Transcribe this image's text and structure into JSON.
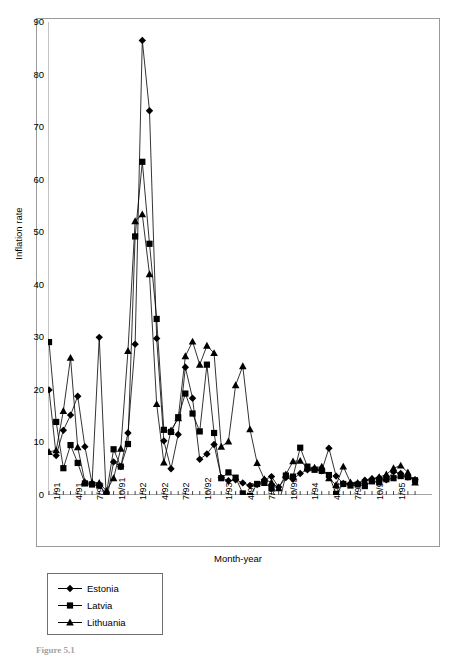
{
  "figure": {
    "caption": "Figure 5.1"
  },
  "axes": {
    "y_title": "Inflation rate",
    "x_title": "Month-year",
    "y_ticks": [
      "0",
      "10",
      "20",
      "30",
      "40",
      "50",
      "60",
      "70",
      "80",
      "90"
    ],
    "x_ticks": [
      "1/91",
      "4/91",
      "7/91",
      "10/91",
      "1/92",
      "4/92",
      "7/92",
      "10/92",
      "1/93",
      "4/93",
      "7/93",
      "10/93",
      "1/94",
      "4/94",
      "7/94",
      "10/94",
      "1/95"
    ]
  },
  "legend": {
    "position": "below-plot-left",
    "entries": [
      {
        "label": "Estonia",
        "marker": "diamond-marker",
        "color": "#000000"
      },
      {
        "label": "Latvia",
        "marker": "square-marker",
        "color": "#000000"
      },
      {
        "label": "Lithuania",
        "marker": "triangle-marker",
        "color": "#000000"
      }
    ]
  },
  "chart_data": {
    "type": "line",
    "title": "",
    "subtitle": "",
    "xlabel": "Month-year",
    "ylabel": "Inflation rate",
    "ylim": [
      0,
      90
    ],
    "ytick_step": 10,
    "grid": false,
    "legend_position": "below-plot-left",
    "x_tick_labels": [
      "1/91",
      "4/91",
      "7/91",
      "10/91",
      "1/92",
      "4/92",
      "7/92",
      "10/92",
      "1/93",
      "4/93",
      "7/93",
      "10/93",
      "1/94",
      "4/94",
      "7/94",
      "10/94",
      "1/95"
    ],
    "x_tick_indices": [
      0,
      3,
      6,
      9,
      12,
      15,
      18,
      21,
      24,
      27,
      30,
      33,
      36,
      39,
      42,
      45,
      48
    ],
    "x_axis_note": "monthly observations, index 0 = 1/91 through index 51 = 4/95",
    "x": [
      "1/91",
      "2/91",
      "3/91",
      "4/91",
      "5/91",
      "6/91",
      "7/91",
      "8/91",
      "9/91",
      "10/91",
      "11/91",
      "12/91",
      "1/92",
      "2/92",
      "3/92",
      "4/92",
      "5/92",
      "6/92",
      "7/92",
      "8/92",
      "9/92",
      "10/92",
      "11/92",
      "12/92",
      "1/93",
      "2/93",
      "3/93",
      "4/93",
      "5/93",
      "6/93",
      "7/93",
      "8/93",
      "9/93",
      "10/93",
      "11/93",
      "12/93",
      "1/94",
      "2/94",
      "3/94",
      "4/94",
      "5/94",
      "6/94",
      "7/94",
      "8/94",
      "9/94",
      "10/94",
      "11/94",
      "12/94",
      "1/95",
      "2/95",
      "3/95",
      "4/95"
    ],
    "series": [
      {
        "name": "Estonia",
        "marker": "diamond",
        "color": "#000000",
        "values": [
          20.0,
          7.5,
          12.3,
          15.2,
          18.8,
          9.2,
          2.2,
          30.0,
          -1.3,
          6.3,
          5.4,
          11.8,
          28.7,
          86.5,
          73.1,
          29.8,
          10.3,
          5.0,
          11.5,
          24.3,
          18.4,
          6.8,
          7.8,
          9.6,
          3.3,
          2.7,
          2.9,
          2.3,
          1.8,
          2.0,
          2.9,
          3.5,
          1.5,
          3.3,
          3.0,
          4.1,
          4.8,
          5.0,
          4.6,
          8.9,
          3.6,
          2.2,
          2.2,
          2.2,
          2.8,
          3.1,
          3.3,
          2.9,
          4.4,
          4.1,
          3.4,
          2.9
        ]
      },
      {
        "name": "Latvia",
        "marker": "square",
        "color": "#000000",
        "values": [
          29.1,
          13.9,
          5.1,
          9.5,
          6.1,
          2.2,
          2.0,
          1.8,
          0.2,
          8.7,
          5.4,
          9.7,
          49.2,
          63.4,
          47.8,
          33.5,
          12.4,
          12.0,
          14.8,
          19.3,
          15.5,
          12.1,
          24.8,
          11.8,
          3.2,
          4.3,
          3.3,
          0.3,
          -0.2,
          2.1,
          2.3,
          1.3,
          -1.7,
          3.7,
          3.5,
          9.0,
          5.4,
          4.8,
          4.6,
          3.8,
          0.2,
          2.1,
          1.8,
          2.0,
          1.7,
          2.6,
          2.4,
          3.0,
          3.2,
          3.6,
          3.4,
          2.8
        ]
      },
      {
        "name": "Lithuania",
        "marker": "triangle",
        "color": "#000000",
        "values": [
          8.2,
          8.5,
          16.0,
          26.1,
          9.1,
          2.5,
          2.4,
          2.3,
          0.8,
          3.2,
          8.8,
          27.4,
          52.1,
          53.4,
          42.0,
          17.3,
          6.2,
          12.3,
          14.6,
          26.4,
          29.2,
          24.8,
          28.4,
          27.0,
          9.2,
          10.2,
          20.9,
          24.5,
          12.5,
          6.1,
          3.0,
          2.4,
          1.3,
          3.9,
          6.4,
          6.5,
          5.1,
          5.2,
          5.4,
          3.2,
          1.9,
          5.4,
          2.4,
          2.3,
          2.6,
          3.0,
          3.4,
          3.9,
          5.1,
          5.6,
          4.3,
          2.4
        ]
      }
    ]
  }
}
